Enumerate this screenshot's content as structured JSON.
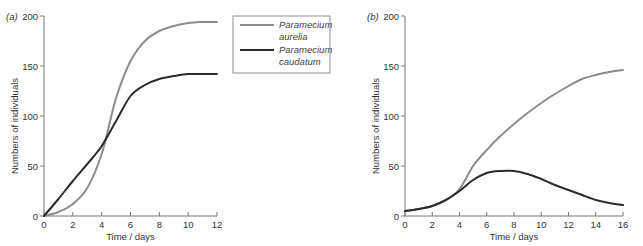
{
  "chart_data": [
    {
      "type": "line",
      "panel_label": "(a)",
      "title": "",
      "xlabel": "Time / days",
      "ylabel": "Numbers of individuals",
      "xlim": [
        0,
        12
      ],
      "ylim": [
        0,
        200
      ],
      "x_ticks": [
        0,
        2,
        4,
        6,
        8,
        10,
        12
      ],
      "y_ticks": [
        0,
        50,
        100,
        150,
        200
      ],
      "grid": false,
      "legend_position": "right-outside-top",
      "x": [
        0,
        1,
        2,
        3,
        4,
        5,
        6,
        7,
        8,
        9,
        10,
        11,
        12
      ],
      "series": [
        {
          "name": "Paramecium aurelia",
          "color": "#8c8c8c",
          "values": [
            0,
            4,
            12,
            28,
            62,
            118,
            155,
            175,
            185,
            190,
            193,
            194,
            194
          ]
        },
        {
          "name": "Paramecium caudatum",
          "color": "#2b2b2b",
          "values": [
            0,
            17,
            35,
            52,
            70,
            95,
            120,
            131,
            137,
            140,
            142,
            142,
            142
          ]
        }
      ]
    },
    {
      "type": "line",
      "panel_label": "(b)",
      "title": "",
      "xlabel": "Time / days",
      "ylabel": "Numbers of individuals",
      "xlim": [
        0,
        16
      ],
      "ylim": [
        0,
        200
      ],
      "x_ticks": [
        0,
        2,
        4,
        6,
        8,
        10,
        12,
        14,
        16
      ],
      "y_ticks": [
        0,
        50,
        100,
        150,
        200
      ],
      "grid": false,
      "x": [
        0,
        1,
        2,
        3,
        4,
        5,
        6,
        7,
        8,
        9,
        10,
        11,
        12,
        13,
        14,
        15,
        16
      ],
      "series": [
        {
          "name": "Paramecium aurelia",
          "color": "#8c8c8c",
          "values": [
            5,
            7,
            10,
            16,
            27,
            50,
            66,
            80,
            92,
            103,
            113,
            122,
            130,
            137,
            141,
            144,
            146
          ]
        },
        {
          "name": "Paramecium caudatum",
          "color": "#2b2b2b",
          "values": [
            5,
            7,
            10,
            16,
            25,
            36,
            43,
            45,
            45,
            42,
            37,
            31,
            26,
            21,
            16,
            13,
            11
          ]
        }
      ]
    }
  ],
  "legend": {
    "items": [
      {
        "line1": "Paramecium",
        "line2": "aurelia",
        "color": "#8c8c8c"
      },
      {
        "line1": "Paramecium",
        "line2": "caudatum",
        "color": "#2b2b2b"
      }
    ]
  }
}
